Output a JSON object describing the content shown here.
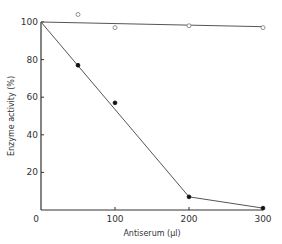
{
  "chart_data": {
    "type": "line",
    "title": "",
    "xlabel": "Antiserum (μl)",
    "ylabel": "Enzyme activity (%)",
    "xlim": [
      0,
      300
    ],
    "ylim": [
      0,
      100
    ],
    "x_ticks": [
      0,
      100,
      200,
      300
    ],
    "y_ticks": [
      20,
      40,
      60,
      80,
      100
    ],
    "x_tick_labels": [
      "0",
      "100",
      "200",
      "300"
    ],
    "y_tick_labels": [
      "20",
      "40",
      "60",
      "80",
      "100"
    ],
    "grid": false,
    "legend": null,
    "series": [
      {
        "name": "control (open circles)",
        "marker": "open-circle",
        "points_x": [
          50,
          100,
          200,
          300
        ],
        "points_y": [
          104,
          97,
          98,
          97
        ],
        "line_x": [
          0,
          300
        ],
        "line_y": [
          100,
          97.5
        ]
      },
      {
        "name": "antiserum (filled circles)",
        "marker": "filled-circle",
        "points_x": [
          50,
          100,
          200,
          300
        ],
        "points_y": [
          77,
          57,
          7,
          1
        ],
        "line_x": [
          0,
          200,
          300
        ],
        "line_y": [
          100,
          7,
          1
        ]
      }
    ]
  }
}
